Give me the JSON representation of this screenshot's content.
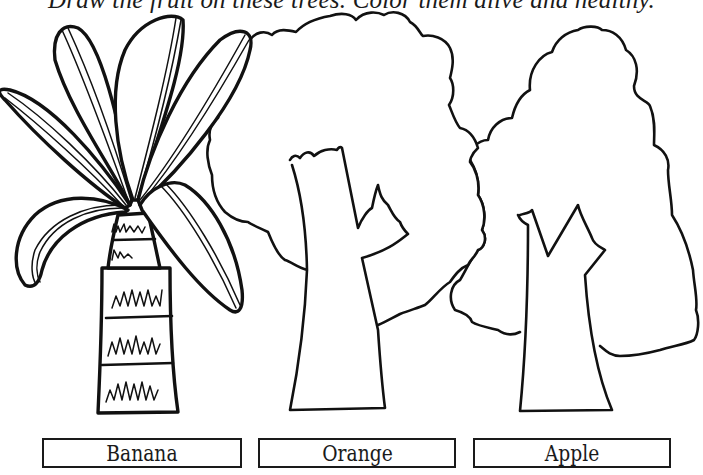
{
  "worksheet": {
    "instructions": "Draw the fruit on these trees. Color them alive and healthy.",
    "trees": [
      {
        "id": "banana",
        "label": "Banana",
        "illustration": "banana-tree-icon"
      },
      {
        "id": "orange",
        "label": "Orange",
        "illustration": "orange-tree-icon"
      },
      {
        "id": "apple",
        "label": "Apple",
        "illustration": "apple-tree-icon"
      }
    ],
    "colors": {
      "ink": "#111111",
      "paper": "#ffffff"
    }
  }
}
